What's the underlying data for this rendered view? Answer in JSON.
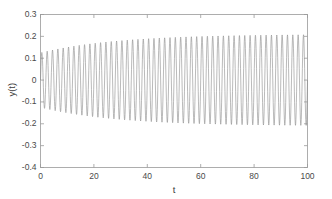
{
  "chart_data": {
    "type": "line",
    "title": "",
    "xlabel": "t",
    "ylabel": "y(t)",
    "xlim": [
      0,
      100
    ],
    "ylim": [
      -0.4,
      0.3
    ],
    "xticks": [
      0,
      20,
      40,
      60,
      80,
      100
    ],
    "yticks": [
      0.3,
      0.2,
      0.1,
      0,
      -0.1,
      -0.2,
      -0.3,
      -0.4
    ],
    "xtick_labels": [
      "0",
      "20",
      "40",
      "60",
      "80",
      "100"
    ],
    "ytick_labels": [
      "0.3",
      "0.2",
      "0.1",
      "0",
      "-0.1",
      "-0.2",
      "-0.3",
      "-0.4"
    ],
    "grid": false,
    "legend": null,
    "line_color": "#8c8c8c",
    "axis_color": "#9a9a9a",
    "background": "#ffffff",
    "series": [
      {
        "name": "y(t)",
        "description": "Rapid sinusoidal oscillation with slowly growing, saturating amplitude envelope",
        "period": 2.0,
        "angular_frequency": 3.1416,
        "envelope_initial": 0.125,
        "envelope_final": 0.21,
        "envelope_growth_rate": 0.035,
        "samples_per_period": 24,
        "x_start": 0,
        "x_end": 100,
        "envelope_points": [
          {
            "t": 0,
            "amp": 0.125
          },
          {
            "t": 10,
            "amp": 0.133
          },
          {
            "t": 20,
            "amp": 0.146
          },
          {
            "t": 30,
            "amp": 0.161
          },
          {
            "t": 40,
            "amp": 0.177
          },
          {
            "t": 50,
            "amp": 0.19
          },
          {
            "t": 60,
            "amp": 0.199
          },
          {
            "t": 70,
            "amp": 0.204
          },
          {
            "t": 80,
            "amp": 0.207
          },
          {
            "t": 90,
            "amp": 0.209
          },
          {
            "t": 100,
            "amp": 0.21
          }
        ]
      }
    ]
  },
  "axes": {
    "xlabel": "t",
    "ylabel": "y(t)"
  }
}
